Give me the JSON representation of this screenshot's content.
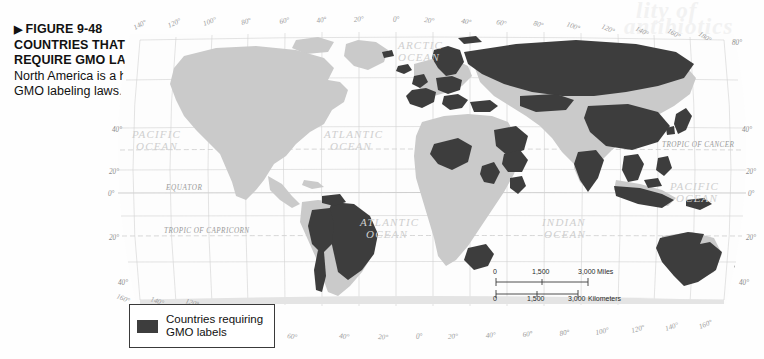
{
  "figure": {
    "arrow_glyph": "▶",
    "label": "FIGURE 9-48",
    "title": "COUNTRIES THAT REQUIRE GMO LABELS",
    "body": "North America is a holdout in GMO labeling laws."
  },
  "legend": {
    "swatch_color": "#3d3d3d",
    "line1": "Countries requiring",
    "line2": "GMO labels"
  },
  "scale": {
    "miles": {
      "ticks": [
        "0",
        "1,500",
        "3,000"
      ],
      "unit": "Miles"
    },
    "kilometers": {
      "ticks": [
        "0",
        "1,500",
        "3,000"
      ],
      "unit": "Kilometers"
    }
  },
  "map": {
    "projection": "Robinson",
    "highlight_color": "#3d3d3d",
    "land_color": "#c9c9c9",
    "ocean_color": "#fdfdfd",
    "graticule_color": "#c9c9c9",
    "ocean_labels": [
      {
        "id": "arctic",
        "text_line1": "ARCTIC",
        "text_line2": "OCEAN"
      },
      {
        "id": "pacific-east",
        "text_line1": "PACIFIC",
        "text_line2": "OCEAN"
      },
      {
        "id": "atlantic-north",
        "text_line1": "ATLANTIC",
        "text_line2": "OCEAN"
      },
      {
        "id": "atlantic-south",
        "text_line1": "ATLANTIC",
        "text_line2": "OCEAN"
      },
      {
        "id": "indian",
        "text_line1": "INDIAN",
        "text_line2": "OCEAN"
      },
      {
        "id": "pacific-west",
        "text_line1": "PACIFIC",
        "text_line2": "OCEAN"
      }
    ],
    "reference_lines": [
      {
        "id": "tropic-of-cancer",
        "label": "TROPIC OF CANCER"
      },
      {
        "id": "equator",
        "label": "EQUATOR"
      },
      {
        "id": "tropic-of-capricorn",
        "label": "TROPIC OF CAPRICORN"
      }
    ],
    "longitude_ticks_top": [
      "140°",
      "120°",
      "100°",
      "80°",
      "60°",
      "40°",
      "20°",
      "0°",
      "20°",
      "40°",
      "60°",
      "80°",
      "100°",
      "120°",
      "140°",
      "160°",
      "180°"
    ],
    "longitude_ticks_bottom": [
      "160°",
      "140°",
      "120°",
      "100°",
      "80°",
      "60°",
      "40°",
      "20°",
      "0°",
      "20°",
      "40°",
      "60°",
      "80°",
      "100°",
      "120°",
      "140°",
      "160°",
      "180°"
    ],
    "latitude_ticks_left": [
      "40°",
      "20°",
      "0°",
      "20°",
      "40°"
    ],
    "latitude_ticks_right": [
      "80°",
      "40°",
      "20°",
      "0°",
      "20°",
      "40°"
    ],
    "highlighted_regions": [
      "Brazil",
      "Peru",
      "Bolivia",
      "Ecuador",
      "Venezuela",
      "Chile (partial)",
      "Russia",
      "China",
      "India",
      "Japan",
      "South Korea",
      "Vietnam",
      "Thailand",
      "Indonesia",
      "Malaysia",
      "Philippines",
      "Kazakhstan",
      "Saudi Arabia",
      "Turkey",
      "Ethiopia",
      "Kenya",
      "Mali",
      "Cameroon",
      "South Africa",
      "Norway",
      "Sweden",
      "Iceland",
      "United Kingdom",
      "Ireland",
      "France",
      "Spain",
      "Portugal",
      "Germany",
      "Poland",
      "Italy",
      "Greece",
      "Ukraine",
      "Australia",
      "New Zealand"
    ]
  }
}
